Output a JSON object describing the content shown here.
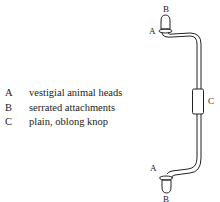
{
  "legend": [
    {
      "key": "A",
      "text": "vestigial animal heads"
    },
    {
      "key": "B",
      "text": "serrated attachments"
    },
    {
      "key": "C",
      "text": "plain, oblong knop"
    }
  ],
  "diagram": {
    "labels": {
      "top_b": "B",
      "top_a": "A",
      "middle_c": "C",
      "bottom_a": "A",
      "bottom_b": "B"
    }
  }
}
